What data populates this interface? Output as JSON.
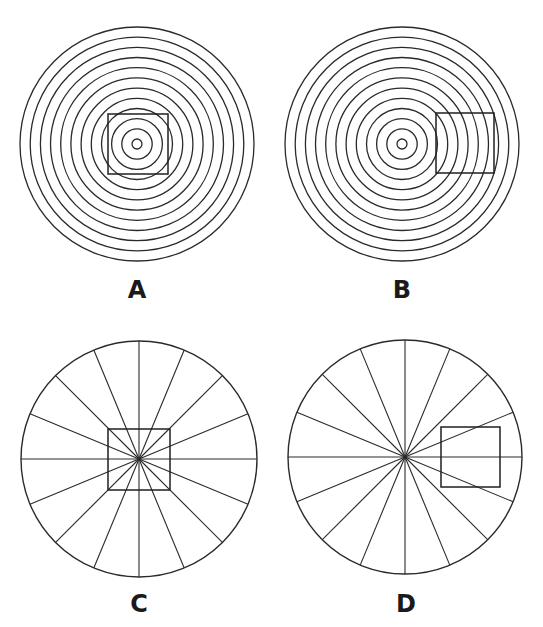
{
  "figure": {
    "colors": {
      "ink": "#2a2a2a",
      "background": "#ffffff"
    },
    "panels": [
      {
        "id": "A",
        "label": "A",
        "pattern": "concentric-rings",
        "center": [
          137,
          144
        ],
        "outer_radius": 117,
        "ring_count": 12,
        "square": {
          "x": 108,
          "y": 114,
          "w": 60,
          "h": 60,
          "position": "centered"
        },
        "label_pos": [
          137,
          298
        ]
      },
      {
        "id": "B",
        "label": "B",
        "pattern": "concentric-rings",
        "center": [
          402,
          144
        ],
        "outer_radius": 117,
        "ring_count": 12,
        "square": {
          "x": 436,
          "y": 113,
          "w": 58,
          "h": 60,
          "position": "off-center-right"
        },
        "label_pos": [
          402,
          298
        ]
      },
      {
        "id": "C",
        "label": "C",
        "pattern": "radial-spokes",
        "center": [
          139,
          459
        ],
        "outer_radius": 118,
        "spoke_count": 16,
        "square": {
          "x": 108,
          "y": 429,
          "w": 62,
          "h": 61,
          "position": "centered"
        },
        "label_pos": [
          139,
          612
        ]
      },
      {
        "id": "D",
        "label": "D",
        "pattern": "radial-spokes",
        "center": [
          405,
          457
        ],
        "outer_radius": 117,
        "spoke_count": 16,
        "square": {
          "x": 441,
          "y": 427,
          "w": 59,
          "h": 60,
          "position": "off-center-right"
        },
        "label_pos": [
          406,
          612
        ]
      }
    ]
  }
}
